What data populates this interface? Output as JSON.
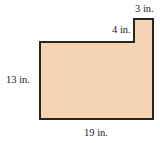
{
  "figure": {
    "type": "composite-rectangle",
    "fill_color": "#f5d4b3",
    "stroke_color": "#2a2420",
    "labels": {
      "width_top_tab": "3 in.",
      "tab_height": "4 in.",
      "left_height": "13 in.",
      "bottom_width": "19 in."
    }
  }
}
